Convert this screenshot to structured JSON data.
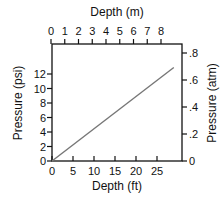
{
  "chart_data": {
    "type": "line",
    "title": "",
    "xlabel": "Depth (ft)",
    "ylabel": "Pressure (psi)",
    "x2label": "Depth (m)",
    "y2label": "Pressure (atm)",
    "xlim": [
      0,
      31
    ],
    "ylim": [
      0,
      16.3
    ],
    "x_ticks": [
      "0",
      "5",
      "10",
      "15",
      "20",
      "25"
    ],
    "x_tick_values": [
      0,
      5,
      10,
      15,
      20,
      25
    ],
    "y_ticks": [
      "0",
      "2",
      "4",
      "6",
      "8",
      "10",
      "12"
    ],
    "y_tick_values": [
      0,
      2,
      4,
      6,
      8,
      10,
      12
    ],
    "x2_ticks": [
      "0",
      "1",
      "2",
      "3",
      "4",
      "5",
      "6",
      "7",
      "8"
    ],
    "x2_tick_values": [
      0,
      1,
      2,
      3,
      4,
      5,
      6,
      7,
      8
    ],
    "y2_ticks": [
      "0",
      ".2",
      ".4",
      ".6",
      ".8"
    ],
    "y2_tick_values": [
      0,
      0.2,
      0.4,
      0.6,
      0.8
    ],
    "grid": false,
    "legend": null,
    "series": [
      {
        "name": "Pressure vs Depth",
        "x": [
          0,
          29
        ],
        "y": [
          0,
          12.9
        ],
        "color": "#777777"
      }
    ]
  }
}
